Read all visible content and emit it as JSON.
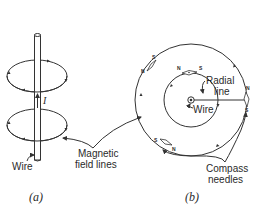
{
  "figure": {
    "panel_a": {
      "caption": "(a)",
      "labels": {
        "wire": "Wire",
        "current": "I"
      }
    },
    "panel_b": {
      "caption": "(b)",
      "labels": {
        "radial_line_1": "Radial",
        "radial_line_2": "line",
        "wire": "Wire",
        "compass_1": "Compass",
        "compass_2": "needles"
      },
      "compass_needles": [
        {
          "position": "outer-top-left",
          "north": "N",
          "south": "S"
        },
        {
          "position": "inner-top",
          "north": "N",
          "south": "S"
        },
        {
          "position": "outer-right",
          "north": "N",
          "south": "S"
        },
        {
          "position": "outer-bottom-left",
          "north": "N",
          "south": "S"
        }
      ]
    },
    "shared_labels": {
      "field_lines_1": "Magnetic",
      "field_lines_2": "field lines"
    },
    "colors": {
      "ink": "#333333",
      "background": "#ffffff"
    }
  }
}
